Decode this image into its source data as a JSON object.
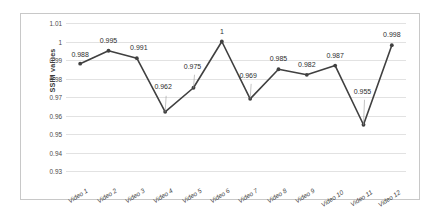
{
  "chart_data": {
    "type": "line",
    "title": "",
    "xlabel": "",
    "ylabel": "SSIM values",
    "categories": [
      "Video 1",
      "Video 2",
      "Video 3",
      "Video 4",
      "Video 5",
      "Video 6",
      "Video 7",
      "Video 8",
      "Video 9",
      "Video 10",
      "Video 11",
      "Video 12"
    ],
    "values": [
      0.988,
      0.995,
      0.991,
      0.962,
      0.975,
      1,
      0.969,
      0.985,
      0.982,
      0.987,
      0.955,
      0.998
    ],
    "point_labels": [
      "0.988",
      "0.995",
      "0.991",
      "0.962",
      "0.975",
      "1",
      "0.969",
      "0.985",
      "0.982",
      "0.987",
      "0.955",
      "0.998"
    ],
    "ylim": [
      0.93,
      1.01
    ],
    "ytick_values": [
      0.93,
      0.94,
      0.95,
      0.96,
      0.97,
      0.98,
      0.99,
      1,
      1.01
    ],
    "ytick_labels": [
      "0.93",
      "0.94",
      "0.95",
      "0.96",
      "0.97",
      "0.98",
      "0.99",
      "1",
      "1.01"
    ],
    "grid": true,
    "legend": false,
    "legend_position": "none",
    "series_color": "#404040",
    "marker": "circle",
    "gridline_color": "#e2e2e2",
    "border_color": "#c8c8c8",
    "background_color": "#ffffff"
  }
}
